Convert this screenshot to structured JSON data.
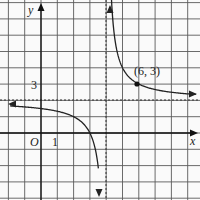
{
  "chart_data": {
    "type": "line",
    "title": "",
    "xlabel": "x",
    "ylabel": "y",
    "function": "y = 2 + 2/(x - 4)",
    "xlim": [
      -2,
      9.5
    ],
    "ylim": [
      -4,
      8
    ],
    "grid": true,
    "tick_labels": {
      "origin": "O",
      "x_tick": "1",
      "y_tick": "3"
    },
    "asymptotes": {
      "vertical": 4,
      "horizontal": 2
    },
    "annotations": [
      {
        "label": "(6, 3)",
        "x": 6,
        "y": 3
      }
    ],
    "series": [
      {
        "name": "left branch",
        "x": [
          -2.3,
          -1,
          0,
          1,
          2,
          3,
          3.5,
          3.8
        ],
        "y": [
          1.7,
          1.6,
          1.5,
          1.33,
          1.0,
          0.0,
          -2.0,
          -8.0
        ]
      },
      {
        "name": "right branch",
        "x": [
          4.25,
          4.5,
          5,
          6,
          8,
          9.7
        ],
        "y": [
          10.0,
          6.0,
          4.0,
          3.0,
          2.5,
          2.35
        ]
      }
    ]
  },
  "labels": {
    "y_axis": "y",
    "x_axis": "x",
    "origin": "O",
    "x_one": "1",
    "y_three": "3",
    "point": "(6, 3)"
  },
  "colors": {
    "grid": "#555555",
    "curve": "#222222",
    "background": "#ffffff"
  }
}
